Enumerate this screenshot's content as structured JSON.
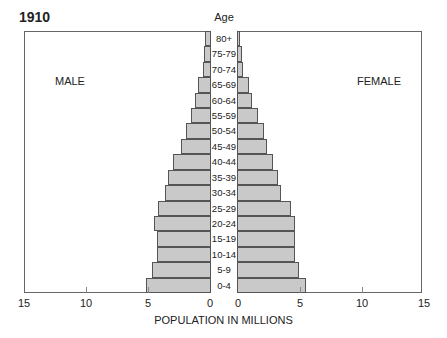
{
  "chart_data": {
    "type": "bar",
    "subtype": "population-pyramid",
    "title": "1910",
    "center_label": "Age",
    "xlabel": "POPULATION IN MILLIONS",
    "ylabel": "Age",
    "categories": [
      "80+",
      "75-79",
      "70-74",
      "65-69",
      "60-64",
      "55-59",
      "50-54",
      "45-49",
      "40-44",
      "35-39",
      "30-34",
      "25-29",
      "20-24",
      "15-19",
      "10-14",
      "5-9",
      "0-4"
    ],
    "series": [
      {
        "name": "MALE",
        "side": "left",
        "values": [
          0.4,
          0.5,
          0.6,
          1.0,
          1.2,
          1.5,
          1.9,
          2.3,
          3.0,
          3.4,
          3.6,
          4.2,
          4.5,
          4.3,
          4.3,
          4.7,
          5.2
        ]
      },
      {
        "name": "FEMALE",
        "side": "right",
        "values": [
          0.2,
          0.3,
          0.4,
          0.9,
          1.1,
          1.6,
          2.1,
          2.3,
          2.8,
          3.2,
          3.5,
          4.3,
          4.6,
          4.6,
          4.6,
          4.9,
          5.5
        ]
      }
    ],
    "xlim": [
      0,
      15
    ],
    "left_ticks": [
      "15",
      "10",
      "5",
      "0"
    ],
    "right_ticks": [
      "0",
      "5",
      "10",
      "15"
    ],
    "grid": false,
    "legend": {
      "left_label": "MALE",
      "right_label": "FEMALE"
    },
    "colors": {
      "bar_fill": "#c9c9c9",
      "bar_border": "#555555"
    }
  }
}
